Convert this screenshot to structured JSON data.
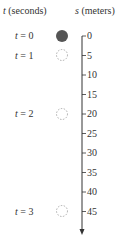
{
  "header": {
    "time_var": "t",
    "time_unit": "(seconds)",
    "pos_var": "s",
    "pos_unit": "(meters)"
  },
  "times": [
    {
      "label": "t = 0",
      "var": "t",
      "value": "= 0",
      "position_m": 0,
      "marker": "filled"
    },
    {
      "label": "t = 1",
      "var": "t",
      "value": "= 1",
      "position_m": 5,
      "marker": "dashed"
    },
    {
      "label": "t = 2",
      "var": "t",
      "value": "= 2",
      "position_m": 20,
      "marker": "dashed"
    },
    {
      "label": "t = 3",
      "var": "t",
      "value": "= 3",
      "position_m": 45,
      "marker": "dashed"
    }
  ],
  "axis": {
    "ticks": [
      "0",
      "5",
      "10",
      "15",
      "20",
      "25",
      "30",
      "35",
      "40",
      "45"
    ],
    "direction": "down"
  },
  "colors": {
    "ball": "#555555",
    "line": "#333333"
  }
}
